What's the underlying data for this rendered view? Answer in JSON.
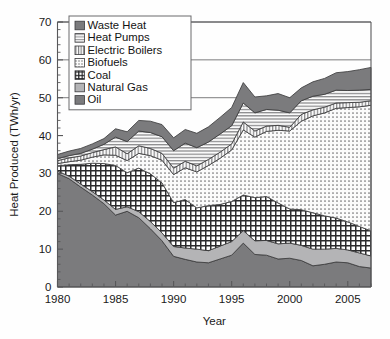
{
  "chart_data": {
    "type": "area",
    "stacked": true,
    "title": "",
    "xlabel": "Year",
    "ylabel": "Heat Produced (TWh/yr)",
    "xlim": [
      1980,
      2007
    ],
    "ylim": [
      0,
      70
    ],
    "yticks": [
      0,
      10,
      20,
      30,
      40,
      50,
      60,
      70
    ],
    "xticks": [
      1980,
      1985,
      1990,
      1995,
      2000,
      2005
    ],
    "xtick_labels": [
      "1980",
      "1985",
      "1990",
      "1995",
      "2000",
      "2005"
    ],
    "ytick_labels": [
      "0",
      "10",
      "20",
      "30",
      "40",
      "50",
      "60",
      "70"
    ],
    "x_minor_step": 1,
    "grid": "horizontal-partial",
    "grid_values": [
      50,
      60,
      70
    ],
    "legend_position": "top-left-inside",
    "stack_order_bottom_to_top": [
      "Oil",
      "Natural Gas",
      "Coal",
      "Biofuels",
      "Electric Boilers",
      "Heat Pumps",
      "Waste Heat"
    ],
    "x": [
      1980,
      1981,
      1982,
      1983,
      1984,
      1985,
      1986,
      1987,
      1988,
      1989,
      1990,
      1991,
      1992,
      1993,
      1994,
      1995,
      1996,
      1997,
      1998,
      1999,
      2000,
      2001,
      2002,
      2003,
      2004,
      2005,
      2006,
      2007
    ],
    "series": [
      {
        "name": "Oil",
        "pattern": "solid-dark-gray",
        "color": "#7b7b7d",
        "values": [
          30.0,
          28.6,
          26.4,
          24.3,
          22.0,
          19.0,
          20.0,
          18.3,
          15.4,
          12.2,
          8.1,
          7.3,
          6.6,
          6.4,
          7.4,
          8.4,
          11.6,
          8.6,
          8.4,
          7.4,
          7.6,
          7.0,
          5.6,
          6.0,
          6.6,
          6.4,
          5.4,
          5.0
        ]
      },
      {
        "name": "Natural Gas",
        "pattern": "solid-mid-gray",
        "color": "#b4b4b6",
        "values": [
          0.6,
          0.7,
          0.8,
          0.9,
          1.0,
          1.5,
          1.2,
          1.6,
          1.9,
          2.1,
          2.6,
          3.0,
          3.4,
          3.2,
          3.4,
          3.6,
          3.3,
          3.6,
          3.9,
          4.0,
          4.0,
          4.0,
          4.4,
          4.0,
          3.6,
          3.4,
          3.6,
          3.2
        ]
      },
      {
        "name": "Coal",
        "pattern": "checkerboard",
        "color": "#ffffff",
        "values": [
          1.4,
          3.0,
          5.2,
          7.5,
          9.6,
          11.6,
          9.0,
          11.5,
          12.6,
          13.2,
          11.6,
          12.8,
          10.9,
          11.9,
          11.0,
          10.6,
          9.4,
          11.4,
          11.6,
          10.8,
          9.0,
          9.4,
          9.6,
          8.8,
          8.0,
          7.4,
          7.0,
          6.6
        ]
      },
      {
        "name": "Biofuels",
        "pattern": "dotted",
        "color": "#f2f2f2",
        "values": [
          0.6,
          0.8,
          1.1,
          1.6,
          2.3,
          2.7,
          3.2,
          3.9,
          4.8,
          6.0,
          7.4,
          8.4,
          9.5,
          10.6,
          12.2,
          13.6,
          17.2,
          16.0,
          17.2,
          19.2,
          20.6,
          23.4,
          25.6,
          27.2,
          29.0,
          30.2,
          31.6,
          33.2
        ]
      },
      {
        "name": "Electric Boilers",
        "pattern": "vertical-lines",
        "color": "#e3e3e3",
        "values": [
          0.8,
          1.0,
          1.1,
          1.2,
          1.4,
          2.2,
          1.8,
          2.0,
          1.9,
          1.8,
          1.7,
          1.7,
          1.6,
          1.6,
          1.6,
          1.6,
          2.1,
          1.6,
          1.4,
          1.3,
          1.0,
          1.8,
          1.6,
          1.5,
          1.4,
          1.3,
          1.2,
          1.2
        ]
      },
      {
        "name": "Heat Pumps",
        "pattern": "horizontal-lines",
        "color": "#ededed",
        "values": [
          0.5,
          0.6,
          0.7,
          0.9,
          1.4,
          2.6,
          3.2,
          3.9,
          4.2,
          4.4,
          4.6,
          4.8,
          4.8,
          4.6,
          4.8,
          4.8,
          5.0,
          4.8,
          4.4,
          4.0,
          3.8,
          3.6,
          3.6,
          3.4,
          3.4,
          3.2,
          3.2,
          3.0
        ]
      },
      {
        "name": "Waste Heat",
        "pattern": "solid-dark-gray",
        "color": "#7b7b7d",
        "values": [
          1.1,
          1.2,
          1.3,
          1.4,
          1.5,
          2.2,
          2.6,
          2.8,
          3.0,
          3.2,
          3.4,
          3.6,
          3.8,
          4.0,
          4.4,
          4.8,
          5.4,
          4.2,
          3.6,
          4.4,
          4.0,
          3.4,
          3.8,
          4.2,
          4.6,
          5.0,
          5.4,
          5.8
        ]
      }
    ],
    "legend_entries": [
      {
        "label": "Waste Heat",
        "pattern": "solid-dark-gray"
      },
      {
        "label": "Heat Pumps",
        "pattern": "horizontal-lines"
      },
      {
        "label": "Electric Boilers",
        "pattern": "vertical-lines"
      },
      {
        "label": "Biofuels",
        "pattern": "dotted"
      },
      {
        "label": "Coal",
        "pattern": "checkerboard"
      },
      {
        "label": "Natural Gas",
        "pattern": "solid-mid-gray"
      },
      {
        "label": "Oil",
        "pattern": "solid-dark-gray"
      }
    ]
  }
}
